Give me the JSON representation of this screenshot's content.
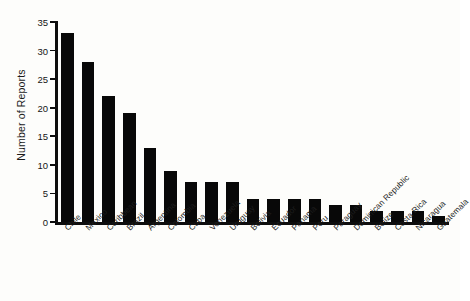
{
  "chart_data": {
    "type": "bar",
    "title": "",
    "xlabel": "",
    "ylabel": "Number of Reports",
    "ylim": [
      0,
      35
    ],
    "yticks": [
      0,
      5,
      10,
      15,
      20,
      25,
      30,
      35
    ],
    "grid": false,
    "legend": null,
    "bar_color": "#080808",
    "background_color": "#fdfdfb",
    "axis_color": "#0d0d0d",
    "categories": [
      "Chile",
      "Mexico",
      "Caribbean",
      "Brazil",
      "Argentina",
      "Colombia",
      "Cuba",
      "Venezuela",
      "Uruguay",
      "Bolivia",
      "Ecuador",
      "Panama",
      "Peru",
      "Paraguay",
      "Dominican Republic",
      "Belize",
      "Costa Rica",
      "Nicaragua",
      "Guatemala"
    ],
    "values": [
      33,
      28,
      22,
      19,
      13,
      9,
      7,
      7,
      7,
      4,
      4,
      4,
      4,
      3,
      3,
      2,
      2,
      2,
      1
    ]
  }
}
